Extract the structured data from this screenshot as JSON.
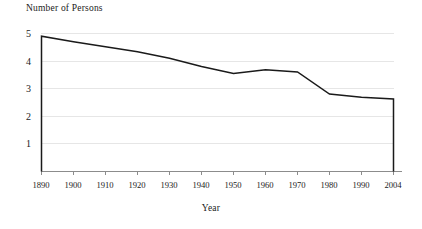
{
  "chart_data": {
    "type": "line",
    "title": "",
    "ylabel": "Number of Persons",
    "xlabel": "Year",
    "x": [
      1890,
      1900,
      1910,
      1920,
      1930,
      1940,
      1950,
      1960,
      1970,
      1980,
      1990,
      2004
    ],
    "values": [
      4.9,
      4.7,
      4.52,
      4.34,
      4.1,
      3.8,
      3.55,
      3.68,
      3.6,
      2.8,
      2.68,
      2.62
    ],
    "series": [
      {
        "name": "Number of Persons",
        "values": [
          4.9,
          4.7,
          4.52,
          4.34,
          4.1,
          3.8,
          3.55,
          3.68,
          3.6,
          2.8,
          2.68,
          2.62
        ]
      }
    ],
    "x_tick_labels": [
      "1890",
      "1900",
      "1910",
      "1920",
      "1930",
      "1940",
      "1950",
      "1960",
      "1970",
      "1980",
      "1990",
      "2004"
    ],
    "y_tick_labels": [
      "1",
      "2",
      "3",
      "4",
      "5"
    ],
    "y_ticks": [
      1,
      2,
      3,
      4,
      5
    ],
    "ylim": [
      0,
      5.35
    ],
    "xlim": [
      1890,
      2004
    ],
    "grid": true,
    "legend": false,
    "legend_position": "none",
    "line_color": "#1a1a1a",
    "grid_color": "#e6e6e6",
    "axis_color": "#8c8c8c",
    "drop_to_baseline_at_ends": true
  },
  "axes": {
    "y_axis_title": "Number of Persons",
    "x_axis_title": "Year"
  }
}
